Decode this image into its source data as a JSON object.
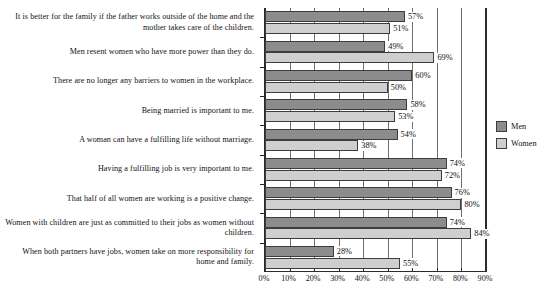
{
  "chart_data": {
    "type": "bar",
    "orientation": "horizontal",
    "title": "",
    "subtitle": "",
    "xlabel": "",
    "ylabel": "",
    "xlim": [
      0,
      90
    ],
    "xticks": [
      0,
      10,
      20,
      30,
      40,
      50,
      60,
      70,
      80,
      90
    ],
    "xtick_labels": [
      "0%",
      "10%",
      "20%",
      "30%",
      "40%",
      "50%",
      "60%",
      "70%",
      "80%",
      "90%"
    ],
    "grid": true,
    "grid_axis": "x",
    "legend_position": "right",
    "value_label_suffix": "%",
    "categories": [
      "It is better for the family if the father works outside of the home and the mother takes care of the children.",
      "Men resent women who have more power than they do.",
      "There are no longer any barriers to women in the workplace.",
      "Being married is important to me.",
      "A woman can have a fulfilling life without marriage.",
      "Having a fulfilling job is very important to me.",
      "That half of all women are working is a positive change.",
      "Women with children are just as committed to their jobs as women without children.",
      "When both partners have jobs, women take on more responsibility for home and family."
    ],
    "series": [
      {
        "name": "Men",
        "color": "#8c8c8c",
        "values": [
          57,
          49,
          60,
          58,
          54,
          74,
          76,
          74,
          28
        ],
        "value_labels": [
          "57%",
          "49%",
          "60%",
          "58%",
          "54%",
          "74%",
          "76%",
          "74%",
          "28%"
        ]
      },
      {
        "name": "Women",
        "color": "#cfcfcf",
        "values": [
          51,
          69,
          50,
          53,
          38,
          72,
          80,
          84,
          55
        ],
        "value_labels": [
          "51%",
          "69%",
          "50%",
          "53%",
          "38%",
          "72%",
          "80%",
          "84%",
          "55%"
        ]
      }
    ]
  },
  "legend": {
    "items": [
      {
        "label": "Men",
        "swatch": "men"
      },
      {
        "label": "Women",
        "swatch": "women"
      }
    ]
  }
}
